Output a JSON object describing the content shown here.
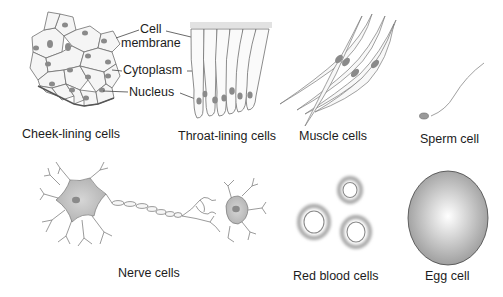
{
  "figure": {
    "panels": [
      {
        "id": "cheek",
        "label": "Cheek-lining cells"
      },
      {
        "id": "throat",
        "label": "Throat-lining cells"
      },
      {
        "id": "muscle",
        "label": "Muscle cells"
      },
      {
        "id": "sperm",
        "label": "Sperm cell"
      },
      {
        "id": "nerve",
        "label": "Nerve cells"
      },
      {
        "id": "rbc",
        "label": "Red blood cells"
      },
      {
        "id": "egg",
        "label": "Egg cell"
      }
    ],
    "callouts": {
      "cell_membrane_line1": "Cell",
      "cell_membrane_line2": "membrane",
      "cytoplasm": "Cytoplasm",
      "nucleus": "Nucleus"
    },
    "colors": {
      "outline": "#6e6e6e",
      "nucleus": "#8a8a8a",
      "cell_fill": "#f4f4f4",
      "nerve_fill": "#bdbdbd",
      "egg_fill": "#b5b5b5"
    }
  }
}
